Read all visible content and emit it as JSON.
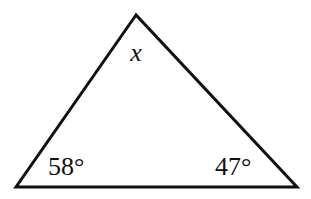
{
  "diagram": {
    "type": "triangle",
    "stroke_color": "#111111",
    "background_color": "#ffffff",
    "vertices": {
      "top": {
        "x": 136,
        "y": 15
      },
      "bottom_left": {
        "x": 16,
        "y": 187
      },
      "bottom_right": {
        "x": 297,
        "y": 187
      }
    },
    "labels": {
      "top_angle": "x",
      "bottom_left_angle": "58°",
      "bottom_right_angle": "47°"
    }
  }
}
